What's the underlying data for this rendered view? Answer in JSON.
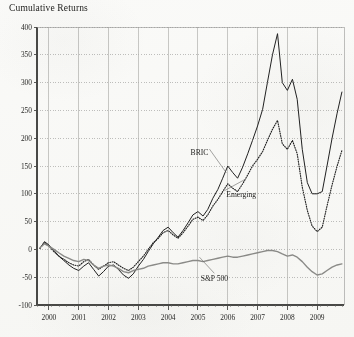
{
  "chart_title": "Cumulative Returns",
  "chart_data": {
    "type": "line",
    "title": "Cumulative Returns",
    "xlabel": "",
    "ylabel": "",
    "xlim": [
      1999.6,
      2009.9
    ],
    "ylim": [
      -100,
      400
    ],
    "grid": true,
    "legend_position": "inline-annotations",
    "yticks": [
      -100,
      -50,
      0,
      50,
      100,
      150,
      200,
      250,
      300,
      350,
      400
    ],
    "ytick_labels": [
      "-100",
      "-50",
      "0",
      "50",
      "100",
      "150",
      "200",
      "250",
      "300",
      "350",
      "400"
    ],
    "xticks": [
      2000,
      2001,
      2002,
      2003,
      2004,
      2005,
      2006,
      2007,
      2008,
      2009
    ],
    "xtick_labels": [
      "2000",
      "2001",
      "2002",
      "2003",
      "2004",
      "2005",
      "2006",
      "2007",
      "2008",
      "2009"
    ],
    "series": [
      {
        "name": "BRIC",
        "style": "solid",
        "color": "#222222",
        "label_x": 2005.05,
        "label_y": 175,
        "x": [
          1999.7,
          1999.85,
          2000.0,
          2000.17,
          2000.33,
          2000.5,
          2000.67,
          2000.83,
          2001.0,
          2001.17,
          2001.33,
          2001.5,
          2001.67,
          2001.83,
          2002.0,
          2002.17,
          2002.33,
          2002.5,
          2002.67,
          2002.83,
          2003.0,
          2003.17,
          2003.33,
          2003.5,
          2003.67,
          2003.83,
          2004.0,
          2004.17,
          2004.33,
          2004.5,
          2004.67,
          2004.83,
          2005.0,
          2005.17,
          2005.33,
          2005.5,
          2005.67,
          2005.83,
          2006.0,
          2006.17,
          2006.33,
          2006.5,
          2006.67,
          2006.83,
          2007.0,
          2007.17,
          2007.33,
          2007.5,
          2007.67,
          2007.83,
          2008.0,
          2008.17,
          2008.33,
          2008.5,
          2008.67,
          2008.83,
          2009.0,
          2009.17,
          2009.33,
          2009.5,
          2009.67,
          2009.83
        ],
        "y": [
          2,
          14,
          8,
          -2,
          -12,
          -20,
          -28,
          -34,
          -38,
          -30,
          -24,
          -36,
          -48,
          -40,
          -30,
          -28,
          -36,
          -46,
          -52,
          -44,
          -30,
          -18,
          -4,
          10,
          22,
          34,
          40,
          30,
          22,
          34,
          48,
          62,
          68,
          60,
          72,
          92,
          108,
          128,
          150,
          138,
          128,
          148,
          172,
          196,
          222,
          252,
          300,
          350,
          388,
          300,
          286,
          306,
          270,
          180,
          120,
          100,
          100,
          104,
          150,
          200,
          245,
          283
        ]
      },
      {
        "name": "Emerging",
        "style": "dotted",
        "color": "#222222",
        "label_x": 2005.95,
        "label_y": 100,
        "x": [
          1999.7,
          1999.85,
          2000.0,
          2000.17,
          2000.33,
          2000.5,
          2000.67,
          2000.83,
          2001.0,
          2001.17,
          2001.33,
          2001.5,
          2001.67,
          2001.83,
          2002.0,
          2002.17,
          2002.33,
          2002.5,
          2002.67,
          2002.83,
          2003.0,
          2003.17,
          2003.33,
          2003.5,
          2003.67,
          2003.83,
          2004.0,
          2004.17,
          2004.33,
          2004.5,
          2004.67,
          2004.83,
          2005.0,
          2005.17,
          2005.33,
          2005.5,
          2005.67,
          2005.83,
          2006.0,
          2006.17,
          2006.33,
          2006.5,
          2006.67,
          2006.83,
          2007.0,
          2007.17,
          2007.33,
          2007.5,
          2007.67,
          2007.83,
          2008.0,
          2008.17,
          2008.33,
          2008.5,
          2008.67,
          2008.83,
          2009.0,
          2009.17,
          2009.33,
          2009.5,
          2009.67,
          2009.83
        ],
        "y": [
          2,
          12,
          6,
          -4,
          -12,
          -18,
          -24,
          -28,
          -30,
          -22,
          -18,
          -28,
          -36,
          -30,
          -24,
          -22,
          -28,
          -34,
          -38,
          -32,
          -22,
          -12,
          0,
          12,
          20,
          30,
          34,
          26,
          20,
          30,
          42,
          54,
          58,
          52,
          62,
          78,
          90,
          104,
          118,
          110,
          104,
          118,
          134,
          150,
          162,
          176,
          196,
          216,
          232,
          190,
          180,
          196,
          172,
          112,
          70,
          42,
          32,
          40,
          78,
          116,
          150,
          178
        ]
      },
      {
        "name": "S&P 500",
        "style": "solid-gray",
        "color": "#8e8e8c",
        "label_x": 2005.55,
        "label_y": -52,
        "x": [
          1999.7,
          1999.85,
          2000.0,
          2000.17,
          2000.33,
          2000.5,
          2000.67,
          2000.83,
          2001.0,
          2001.17,
          2001.33,
          2001.5,
          2001.67,
          2001.83,
          2002.0,
          2002.17,
          2002.33,
          2002.5,
          2002.67,
          2002.83,
          2003.0,
          2003.17,
          2003.33,
          2003.5,
          2003.67,
          2003.83,
          2004.0,
          2004.17,
          2004.33,
          2004.5,
          2004.67,
          2004.83,
          2005.0,
          2005.17,
          2005.33,
          2005.5,
          2005.67,
          2005.83,
          2006.0,
          2006.17,
          2006.33,
          2006.5,
          2006.67,
          2006.83,
          2007.0,
          2007.17,
          2007.33,
          2007.5,
          2007.67,
          2007.83,
          2008.0,
          2008.17,
          2008.33,
          2008.5,
          2008.67,
          2008.83,
          2009.0,
          2009.17,
          2009.33,
          2009.5,
          2009.67,
          2009.83
        ],
        "y": [
          3,
          10,
          6,
          0,
          -6,
          -12,
          -16,
          -20,
          -22,
          -18,
          -20,
          -28,
          -34,
          -30,
          -28,
          -30,
          -34,
          -40,
          -42,
          -38,
          -36,
          -34,
          -30,
          -28,
          -26,
          -24,
          -24,
          -26,
          -26,
          -24,
          -22,
          -20,
          -20,
          -22,
          -20,
          -18,
          -16,
          -14,
          -12,
          -14,
          -14,
          -12,
          -10,
          -8,
          -6,
          -4,
          -2,
          -2,
          -4,
          -8,
          -12,
          -10,
          -14,
          -22,
          -32,
          -40,
          -46,
          -44,
          -38,
          -32,
          -28,
          -26
        ]
      }
    ]
  }
}
